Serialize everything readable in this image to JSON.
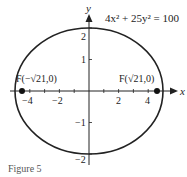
{
  "diagram": {
    "equation": {
      "text": "4x² + 25y² = 100"
    },
    "axes": {
      "x_label": "x",
      "y_label": "y"
    },
    "x_ticks": [
      {
        "value": -4,
        "label": "−4"
      },
      {
        "value": -2,
        "label": "−2"
      },
      {
        "value": 2,
        "label": "2"
      },
      {
        "value": 4,
        "label": "4"
      }
    ],
    "y_ticks": [
      {
        "value": 2,
        "label": "2"
      },
      {
        "value": 1,
        "label": "1"
      },
      {
        "value": -1,
        "label": "−1"
      },
      {
        "value": -2,
        "label": "−2"
      }
    ],
    "foci": [
      {
        "label": "F(−√21,0)",
        "x": -4.58,
        "y": 0
      },
      {
        "label": "F(√21,0)",
        "x": 4.58,
        "y": 0
      }
    ],
    "ellipse": {
      "a": 5,
      "b": 2,
      "center": [
        0,
        0
      ]
    },
    "caption": "Figure 5"
  }
}
